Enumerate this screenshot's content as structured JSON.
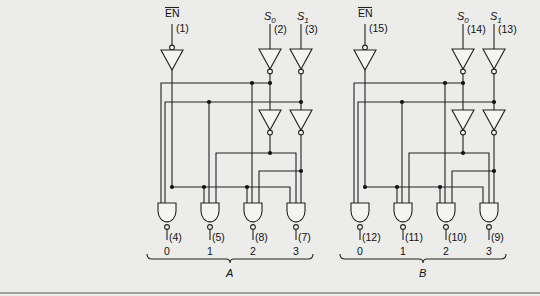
{
  "figure": {
    "sections": [
      {
        "id": "A",
        "label": "A",
        "inputs": {
          "enable": {
            "label": "EN",
            "pin": "(1)"
          },
          "s0": {
            "label": "S",
            "sub": "0",
            "pin": "(2)"
          },
          "s1": {
            "label": "S",
            "sub": "1",
            "pin": "(3)"
          }
        },
        "outputs": [
          {
            "index": "0",
            "pin": "(4)"
          },
          {
            "index": "1",
            "pin": "(5)"
          },
          {
            "index": "2",
            "pin": "(8)"
          },
          {
            "index": "3",
            "pin": "(7)"
          }
        ]
      },
      {
        "id": "B",
        "label": "B",
        "inputs": {
          "enable": {
            "label": "EN",
            "pin": "(15)"
          },
          "s0": {
            "label": "S",
            "sub": "0",
            "pin": "(14)"
          },
          "s1": {
            "label": "S",
            "sub": "1",
            "pin": "(13)"
          }
        },
        "outputs": [
          {
            "index": "0",
            "pin": "(12)"
          },
          {
            "index": "1",
            "pin": "(11)"
          },
          {
            "index": "2",
            "pin": "(10)"
          },
          {
            "index": "3",
            "pin": "(9)"
          }
        ]
      }
    ]
  }
}
